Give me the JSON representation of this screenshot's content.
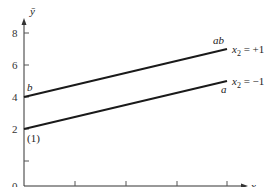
{
  "chart_data": {
    "type": "line",
    "title": "",
    "xlabel": "x1",
    "ylabel": "ȳ",
    "xlim": [
      -1.0,
      1.0
    ],
    "ylim": [
      0,
      9
    ],
    "grid": false,
    "x_ticks": [
      "-1.0",
      "-0.5",
      "0.0",
      "0.5",
      "1.0"
    ],
    "y_ticks": [
      "0",
      "2",
      "4",
      "6",
      "8"
    ],
    "series": [
      {
        "name": "x2 = +1",
        "x": [
          -1.0,
          1.0
        ],
        "y": [
          4,
          7
        ],
        "start_label": "b",
        "end_label": "ab"
      },
      {
        "name": "x2 = -1",
        "x": [
          -1.0,
          1.0
        ],
        "y": [
          2,
          5
        ],
        "start_label": "(1)",
        "end_label": "a"
      }
    ]
  },
  "labels": {
    "y_axis": "ȳ",
    "x_axis_main": "x",
    "x_axis_sub": "1",
    "series_hi_x": "x",
    "series_hi_sub": "2",
    "series_hi_eq": " = +1",
    "series_lo_x": "x",
    "series_lo_sub": "2",
    "series_lo_eq": " = −1",
    "pt_b": "b",
    "pt_ab": "ab",
    "pt_1": "(1)",
    "pt_a": "a"
  }
}
